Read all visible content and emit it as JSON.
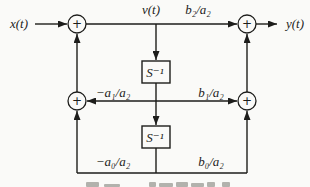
{
  "figure": {
    "background_color": "#fafaf8",
    "line_color": "#1d1d1b",
    "adder_symbol": "+",
    "delay_block_label": "S⁻¹",
    "labels": {
      "input": "x(t)",
      "tap": "v(t)",
      "output": "y(t)",
      "gain_top_right": "b₂/a₂",
      "gain_mid_left": "−a₁/a₂",
      "gain_mid_right": "b₁/a₂",
      "gain_bottom_left": "−a₀/a₂",
      "gain_bottom_right": "b₀/a₂"
    }
  }
}
